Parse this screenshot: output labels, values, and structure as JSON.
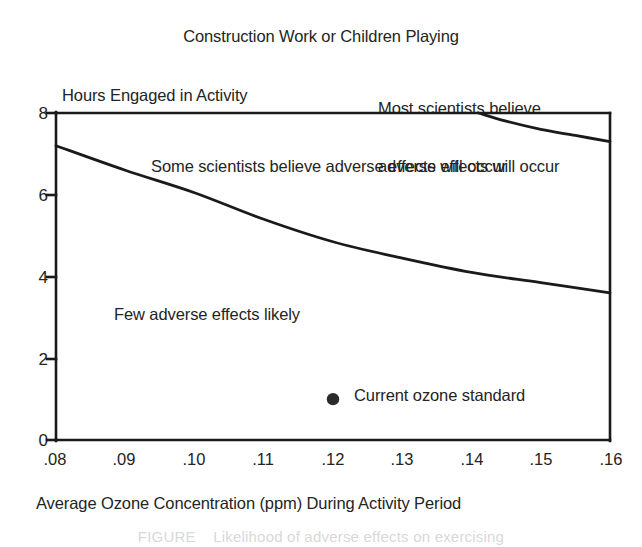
{
  "chart_data": {
    "type": "line",
    "title": "Construction Work or Children Playing",
    "xlabel": "Average Ozone Concentration (ppm) During Activity Period",
    "ylabel": "Hours Engaged in Activity",
    "xlim": [
      0.08,
      0.16
    ],
    "ylim": [
      0,
      8
    ],
    "grid": false,
    "legend": "none",
    "xticks": [
      ".08",
      ".09",
      ".10",
      ".11",
      ".12",
      ".13",
      ".14",
      ".15",
      ".16"
    ],
    "xtick_values": [
      0.08,
      0.09,
      0.1,
      0.11,
      0.12,
      0.13,
      0.14,
      0.15,
      0.16
    ],
    "yticks": [
      "0",
      "2",
      "4",
      "6",
      "8"
    ],
    "ytick_values": [
      0,
      2,
      4,
      6,
      8
    ],
    "series": [
      {
        "name": "Lower threshold boundary",
        "x": [
          0.08,
          0.09,
          0.1,
          0.11,
          0.12,
          0.13,
          0.14,
          0.15,
          0.16
        ],
        "values": [
          7.2,
          6.6,
          6.05,
          5.4,
          4.85,
          4.45,
          4.1,
          3.85,
          3.6
        ]
      },
      {
        "name": "Upper threshold boundary",
        "x": [
          0.141,
          0.145,
          0.15,
          0.155,
          0.16
        ],
        "values": [
          8.0,
          7.8,
          7.6,
          7.45,
          7.3
        ]
      }
    ],
    "points": [
      {
        "name": "Current ozone standard",
        "x": 0.12,
        "y": 1.0,
        "label": "Current ozone standard",
        "marker": "filled-circle"
      }
    ],
    "annotations": [
      {
        "name": "region-most",
        "lines": [
          "Most scientists believe",
          "adverse effects will occur"
        ]
      },
      {
        "name": "region-some",
        "text": "Some scientists believe adverse effects will occur"
      },
      {
        "name": "region-few",
        "text": "Few adverse effects likely"
      }
    ],
    "colors": {
      "line": "#1a1a1a",
      "axis": "#1a1a1a",
      "text": "#242424",
      "background": "#ffffff",
      "marker": "#2b2b2b"
    }
  },
  "caption": {
    "fragment": "FIGURE    Likelihood of adverse effects on exercising"
  }
}
